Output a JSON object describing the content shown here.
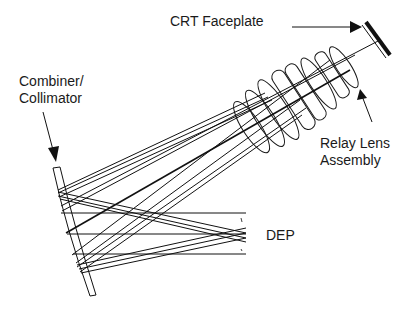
{
  "diagram": {
    "labels": {
      "crt_faceplate": "CRT Faceplate",
      "combiner_line1": "Combiner/",
      "combiner_line2": "Collimator",
      "relay_line1": "Relay Lens",
      "relay_line2": "Assembly",
      "dep": "DEP"
    },
    "components": [
      "CRT Faceplate",
      "Relay Lens Assembly",
      "Combiner/Collimator",
      "DEP (Design Eye Position)"
    ],
    "colors": {
      "line": "#111111",
      "background": "#ffffff"
    }
  }
}
